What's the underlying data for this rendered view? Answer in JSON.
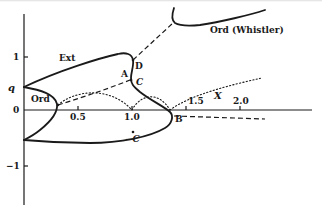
{
  "figure": {
    "y_axis": {
      "ticks": [
        {
          "value": 1,
          "label": "1"
        },
        {
          "value": 0,
          "label": "0"
        },
        {
          "value": -1,
          "label": "−1"
        }
      ],
      "special_label": "q"
    },
    "x_axis": {
      "ticks": [
        {
          "value": 0.5,
          "label": "0.5"
        },
        {
          "value": 1.0,
          "label": "1.0"
        },
        {
          "value": 1.5,
          "label": "1.5"
        },
        {
          "value": 2.0,
          "label": "2.0"
        }
      ],
      "variable_label": "X"
    },
    "branch_labels": {
      "ext": "Ext",
      "ord": "Ord",
      "ord_whistler": "Ord (Whistler)"
    },
    "point_labels": {
      "a": "A",
      "b": "B",
      "c": "C",
      "d": "D",
      "minus_c": "−C"
    },
    "line_styles": {
      "solid": "real roots",
      "dashed": "dashed branch",
      "dotted": "dotted branch"
    },
    "colors": {
      "ink": "#1a1a1a",
      "background": "#ffffff"
    }
  }
}
